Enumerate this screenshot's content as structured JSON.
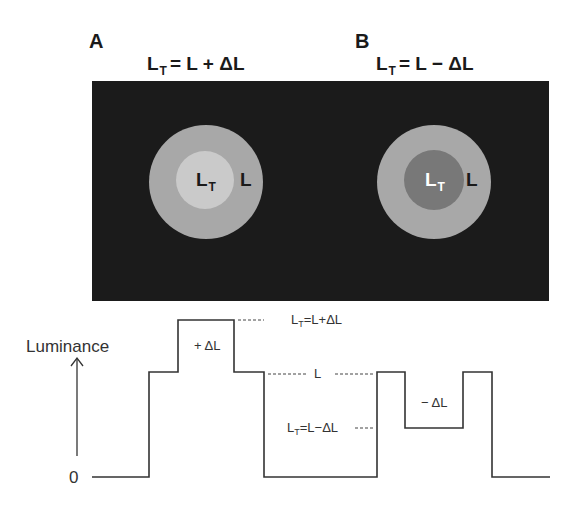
{
  "figure": {
    "panels": [
      {
        "label": "A",
        "formula": {
          "lhs": "L",
          "lhs_sub": "T",
          "rhs": "= L + ΔL"
        },
        "center_label": "L",
        "center_label_sub": "T",
        "surround_label": "L",
        "colors": {
          "surround": "#a8a8a8",
          "center": "#cacaca",
          "center_text": "#1a1a1a"
        }
      },
      {
        "label": "B",
        "formula": {
          "lhs": "L",
          "lhs_sub": "T",
          "rhs": "= L − ΔL"
        },
        "center_label": "L",
        "center_label_sub": "T",
        "surround_label": "L",
        "colors": {
          "surround": "#a8a8a8",
          "center": "#787878",
          "center_text": "#ffffff"
        }
      }
    ],
    "background_color": "#1b1b1b",
    "luminance_profile": {
      "y_axis_label": "Luminance",
      "zero_label": "0",
      "increment_label": "+ ΔL",
      "decrement_label": "− ΔL",
      "reference_label": "L",
      "upper_level_label": {
        "main": "L",
        "sub": "T",
        "rest": "=L+ΔL"
      },
      "lower_level_label": {
        "main": "L",
        "sub": "T",
        "rest": "=L−ΔL"
      },
      "levels": {
        "zero": 0,
        "L": 1,
        "L_plus_dL": 1.5,
        "L_minus_dL": 0.5
      }
    }
  }
}
